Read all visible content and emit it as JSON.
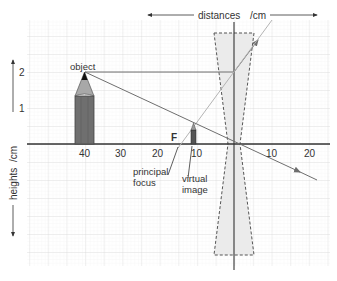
{
  "axes": {
    "x_label": "distances",
    "x_unit": "/cm",
    "y_label": "heights",
    "y_unit": "/cm",
    "x_ticks_left": [
      "40",
      "30",
      "20",
      "10"
    ],
    "x_ticks_right": [
      "10",
      "20"
    ],
    "y_ticks": [
      "2",
      "1"
    ]
  },
  "labels": {
    "object": "object",
    "focus_marker": "F",
    "principal_focus_line1": "principal",
    "principal_focus_line2": "focus",
    "virtual_image_line1": "virtual",
    "virtual_image_line2": "image"
  },
  "elements": {
    "object_distance_cm": 40,
    "object_height_cm": 2,
    "focal_length_cm": 15,
    "image_distance_cm": 11,
    "image_height_cm": 0.55
  },
  "colors": {
    "grid_minor": "#ececec",
    "grid_major": "#d6d6d6",
    "axis": "#333333",
    "ray": "#6e6e6e",
    "ray_light": "#b4b4b4",
    "lens_fill": "#ebebeb",
    "lens_border": "#555555",
    "pencil_body": "#6f6f6f",
    "pencil_wood": "#a8a8a8",
    "pencil_tip": "#111111"
  }
}
